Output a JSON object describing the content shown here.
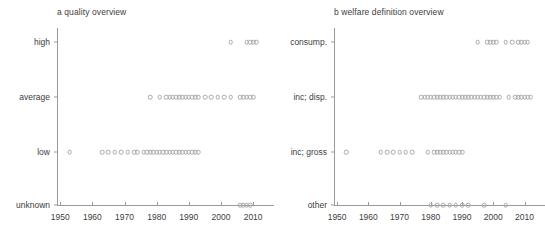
{
  "figure": {
    "background": "#ffffff",
    "point_color": "#a9a9a9",
    "axis_color": "#9a9a9a",
    "text_color": "#404040"
  },
  "chart_data": [
    {
      "type": "scatter",
      "panel": "a",
      "title": "a quality overview",
      "xlabel": "",
      "ylabel": "",
      "xlim": [
        1949,
        2014
      ],
      "xticks": [
        1950,
        1960,
        1970,
        1980,
        1990,
        2000,
        2010
      ],
      "xtick_labels": [
        "1950",
        "1960",
        "1970",
        "1980",
        "1990",
        "2000",
        "2010"
      ],
      "categories": [
        "high",
        "average",
        "low",
        "unknown"
      ],
      "grid": false,
      "legend": "none",
      "series": [
        {
          "name": "high",
          "category": "high",
          "x": [
            2003,
            2008,
            2009,
            2010,
            2011
          ]
        },
        {
          "name": "average",
          "category": "average",
          "x": [
            1978,
            1981,
            1983,
            1984,
            1985,
            1986,
            1987,
            1988,
            1989,
            1990,
            1991,
            1992,
            1993,
            1995,
            1997,
            1999,
            2001,
            2003,
            2006,
            2007,
            2008,
            2009,
            2010
          ]
        },
        {
          "name": "low",
          "category": "low",
          "x": [
            1953,
            1963,
            1965,
            1967,
            1969,
            1971,
            1973,
            1974,
            1976,
            1977,
            1978,
            1979,
            1980,
            1981,
            1982,
            1983,
            1984,
            1985,
            1986,
            1987,
            1988,
            1989,
            1990,
            1991,
            1992,
            1993
          ]
        },
        {
          "name": "unknown",
          "category": "unknown",
          "x": [
            2006,
            2007,
            2008,
            2009
          ]
        }
      ]
    },
    {
      "type": "scatter",
      "panel": "b",
      "title": "b welfare definition overview",
      "xlabel": "",
      "ylabel": "",
      "xlim": [
        1949,
        2014
      ],
      "xticks": [
        1950,
        1960,
        1970,
        1980,
        1990,
        2000,
        2010
      ],
      "xtick_labels": [
        "1950",
        "1960",
        "1970",
        "1980",
        "1990",
        "2000",
        "2010"
      ],
      "categories": [
        "consump.",
        "inc; disp.",
        "inc; gross",
        "other"
      ],
      "grid": false,
      "legend": "none",
      "series": [
        {
          "name": "consump.",
          "category": "consump.",
          "x": [
            1995,
            1998,
            1999,
            2000,
            2001,
            2004,
            2006,
            2008,
            2009,
            2010,
            2011
          ]
        },
        {
          "name": "inc; disp.",
          "category": "inc; disp.",
          "x": [
            1977,
            1978,
            1979,
            1980,
            1981,
            1982,
            1983,
            1984,
            1985,
            1986,
            1987,
            1988,
            1989,
            1990,
            1991,
            1992,
            1993,
            1994,
            1995,
            1996,
            1997,
            1998,
            1999,
            2000,
            2001,
            2002,
            2005,
            2007,
            2008,
            2009,
            2010,
            2011,
            2012
          ]
        },
        {
          "name": "inc; gross",
          "category": "inc; gross",
          "x": [
            1953,
            1964,
            1966,
            1968,
            1970,
            1972,
            1974,
            1979,
            1981,
            1982,
            1983,
            1984,
            1985,
            1986,
            1987,
            1988,
            1989,
            1990
          ]
        },
        {
          "name": "other",
          "category": "other",
          "x": [
            1980,
            1982,
            1984,
            1986,
            1988,
            1990,
            1992,
            1997,
            2004
          ]
        }
      ]
    }
  ]
}
